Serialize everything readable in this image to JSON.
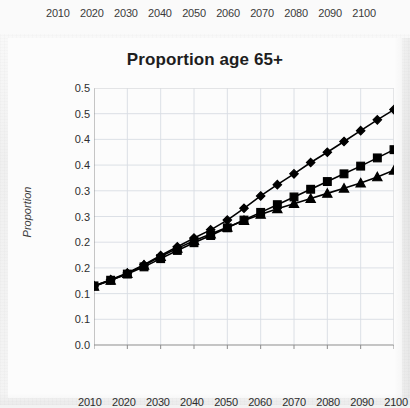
{
  "top_strip": {
    "axis_tick_labels": [
      "2010",
      "2020",
      "2030",
      "2040",
      "2050",
      "2060",
      "2070",
      "2080",
      "2090",
      "2100"
    ]
  },
  "chart_data": {
    "type": "line",
    "title": "Proportion age 65+",
    "xlabel": "",
    "ylabel": "Proportion",
    "x": [
      2010,
      2015,
      2020,
      2025,
      2030,
      2035,
      2040,
      2045,
      2050,
      2055,
      2060,
      2065,
      2070,
      2075,
      2080,
      2085,
      2090,
      2095,
      2100
    ],
    "xlim": [
      2010,
      2100
    ],
    "ylim": [
      0.0,
      0.5
    ],
    "xtick_labels": [
      "2010",
      "2020",
      "2030",
      "2040",
      "2050",
      "2060",
      "2070",
      "2080",
      "2090",
      "2100"
    ],
    "xticks": [
      2010,
      2020,
      2030,
      2040,
      2050,
      2060,
      2070,
      2080,
      2090,
      2100
    ],
    "ytick_labels": [
      "0.5",
      "0.5",
      "0.4",
      "0.4",
      "0.3",
      "0.3",
      "0.2",
      "0.2",
      "0.1",
      "0.1",
      "0.0"
    ],
    "yticks": [
      0.5,
      0.45,
      0.4,
      0.35,
      0.3,
      0.25,
      0.2,
      0.15,
      0.1,
      0.05,
      0.0
    ],
    "grid": true,
    "legend": "none",
    "series": [
      {
        "name": "series-diamond",
        "marker": "diamond",
        "color": "#000000",
        "values": [
          0.115,
          0.127,
          0.14,
          0.156,
          0.174,
          0.191,
          0.208,
          0.224,
          0.243,
          0.266,
          0.29,
          0.312,
          0.333,
          0.355,
          0.375,
          0.396,
          0.417,
          0.438,
          0.458
        ]
      },
      {
        "name": "series-square",
        "marker": "square",
        "color": "#000000",
        "values": [
          0.115,
          0.126,
          0.138,
          0.152,
          0.168,
          0.184,
          0.199,
          0.213,
          0.228,
          0.243,
          0.258,
          0.273,
          0.288,
          0.303,
          0.318,
          0.333,
          0.348,
          0.364,
          0.38
        ]
      },
      {
        "name": "series-triangle",
        "marker": "triangle",
        "color": "#000000",
        "values": [
          0.114,
          0.126,
          0.139,
          0.155,
          0.172,
          0.188,
          0.203,
          0.216,
          0.229,
          0.242,
          0.254,
          0.265,
          0.275,
          0.285,
          0.295,
          0.305,
          0.315,
          0.327,
          0.34
        ]
      }
    ]
  }
}
